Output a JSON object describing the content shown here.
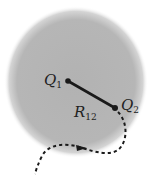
{
  "diagram": {
    "charge1": {
      "label": "Q",
      "subscript": "1"
    },
    "charge2": {
      "label": "Q",
      "subscript": "2"
    },
    "separation": {
      "label": "R",
      "subscript": "12"
    },
    "colors": {
      "region": "#b4b4b4",
      "ink": "#1a1a1a",
      "background": "#ffffff"
    }
  }
}
